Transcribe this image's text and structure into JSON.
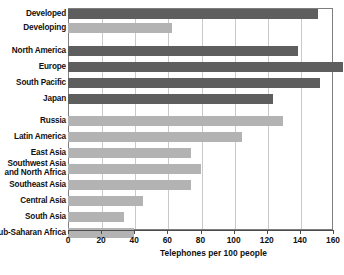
{
  "chart_data": {
    "type": "bar",
    "orientation": "horizontal",
    "title": "",
    "xlabel": "Telephones per 100 people",
    "ylabel": "",
    "xlim": [
      0,
      160
    ],
    "xticks": [
      0,
      20,
      40,
      60,
      80,
      100,
      120,
      140,
      160
    ],
    "grid": "vertical",
    "legend": "none",
    "colors": {
      "dark": "#5e5e5e",
      "light": "#b3b3b3",
      "grid": "#c9c9c9",
      "frame": "#7e7e7e"
    },
    "categories": [
      "Developed",
      "Developing",
      "North America",
      "Europe",
      "South Pacific",
      "Japan",
      "Russia",
      "Latin America",
      "East Asia",
      "Southwest Asia and North Africa",
      "Southeast Asia",
      "Central Asia",
      "South Asia",
      "Sub-Saharan Africa"
    ],
    "values": [
      151,
      63,
      139,
      166,
      152,
      124,
      130,
      105,
      74,
      80,
      74,
      45,
      34,
      40
    ]
  },
  "bars": [
    {
      "label": "Developed",
      "label_line1": "Developed",
      "label_line2": "",
      "value": 151,
      "shade": "dark",
      "top": 9,
      "clipped": false
    },
    {
      "label": "Developing",
      "label_line1": "Developing",
      "label_line2": "",
      "value": 63,
      "shade": "light",
      "top": 23,
      "clipped": false
    },
    {
      "label": "North America",
      "label_line1": "North America",
      "label_line2": "",
      "value": 139,
      "shade": "dark",
      "top": 46,
      "clipped": false
    },
    {
      "label": "Europe",
      "label_line1": "Europe",
      "label_line2": "",
      "value": 166,
      "shade": "dark",
      "top": 62,
      "clipped": true
    },
    {
      "label": "South Pacific",
      "label_line1": "South Pacific",
      "label_line2": "",
      "value": 152,
      "shade": "dark",
      "top": 78,
      "clipped": false
    },
    {
      "label": "Japan",
      "label_line1": "Japan",
      "label_line2": "",
      "value": 124,
      "shade": "dark",
      "top": 94,
      "clipped": false
    },
    {
      "label": "Russia",
      "label_line1": "Russia",
      "label_line2": "",
      "value": 130,
      "shade": "light",
      "top": 116,
      "clipped": false
    },
    {
      "label": "Latin America",
      "label_line1": "Latin America",
      "label_line2": "",
      "value": 105,
      "shade": "light",
      "top": 132,
      "clipped": false
    },
    {
      "label": "East Asia",
      "label_line1": "East Asia",
      "label_line2": "",
      "value": 74,
      "shade": "light",
      "top": 148,
      "clipped": false
    },
    {
      "label": "Southwest Asia and North Africa",
      "label_line1": "Southwest Asia",
      "label_line2": "and North Africa",
      "value": 80,
      "shade": "light",
      "top": 164,
      "clipped": false
    },
    {
      "label": "Southeast Asia",
      "label_line1": "Southeast Asia",
      "label_line2": "",
      "value": 74,
      "shade": "light",
      "top": 180,
      "clipped": false
    },
    {
      "label": "Central Asia",
      "label_line1": "Central Asia",
      "label_line2": "",
      "value": 45,
      "shade": "light",
      "top": 196,
      "clipped": false
    },
    {
      "label": "South Asia",
      "label_line1": "South Asia",
      "label_line2": "",
      "value": 34,
      "shade": "light",
      "top": 212,
      "clipped": false
    },
    {
      "label": "Sub-Saharan Africa",
      "label_line1": "Sub-Saharan Africa",
      "label_line2": "",
      "value": 40,
      "shade": "light",
      "top": 228,
      "clipped": false
    }
  ],
  "axis": {
    "ticks": [
      {
        "value": 0,
        "label": "0"
      },
      {
        "value": 20,
        "label": "20"
      },
      {
        "value": 40,
        "label": "40"
      },
      {
        "value": 60,
        "label": "60"
      },
      {
        "value": 80,
        "label": "80"
      },
      {
        "value": 100,
        "label": "100"
      },
      {
        "value": 120,
        "label": "120"
      },
      {
        "value": 140,
        "label": "140"
      },
      {
        "value": 160,
        "label": "160"
      }
    ],
    "title": "Telephones per 100 people"
  }
}
